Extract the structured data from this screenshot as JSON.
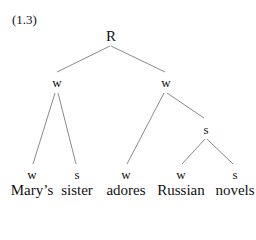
{
  "example_label": "(1.3)",
  "tree": {
    "root": {
      "label": "R",
      "x": 111,
      "y": 29
    },
    "internal": [
      {
        "id": "left-w",
        "label": "w",
        "x": 57,
        "y": 76
      },
      {
        "id": "right-w",
        "label": "w",
        "x": 166,
        "y": 76
      },
      {
        "id": "mid-s",
        "label": "s",
        "x": 206,
        "y": 123
      }
    ],
    "leaves": [
      {
        "label": "w",
        "word": "Mary’s",
        "x": 32
      },
      {
        "label": "s",
        "word": "sister",
        "x": 77
      },
      {
        "label": "w",
        "word": "adores",
        "x": 126
      },
      {
        "label": "w",
        "word": "Russian",
        "x": 181
      },
      {
        "label": "s",
        "word": "novels",
        "x": 235
      }
    ],
    "leaf_label_y": 168,
    "word_y": 183,
    "line_color": "#888888"
  }
}
